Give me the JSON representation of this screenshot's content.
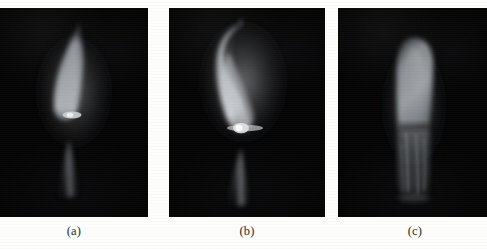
{
  "figure": {
    "kind": "three-panel-photograph-figure",
    "background_color": "#fdfdfc",
    "panel_background_color": "#050505",
    "panel_count": 3
  },
  "panels": [
    {
      "label": "(a)",
      "name": "flame-photo-a",
      "frame": {
        "x": 0,
        "y": 8,
        "width": 148,
        "height": 209
      },
      "caption_center_x": 74,
      "flame": {
        "description": "dim narrow leaf-shaped luminous flame leaning slightly right, with small bright elliptical spot at its base and faint conical tail below",
        "core_color": "#b9bcc0",
        "mid_color": "#6e7276",
        "edge_color": "#2e3134",
        "tail_color": "#4a4d50",
        "hotspot_color": "#e8eaec",
        "brightness": "dim",
        "tip_x": 78,
        "tip_y": 28,
        "base_x": 72,
        "base_y": 118,
        "hotspot_x": 74,
        "hotspot_y": 115,
        "tail_top_y": 140,
        "tail_bottom_y": 200
      }
    },
    {
      "label": "(b)",
      "name": "flame-photo-b",
      "frame": {
        "x": 169,
        "y": 8,
        "width": 156,
        "height": 209
      },
      "caption_center_x": 247,
      "flame": {
        "description": "bright strongly curved hooked flame with tip bending left at top, prominent white hotspot at base and faint conical tail below",
        "core_color": "#d5d8db",
        "mid_color": "#8a8e92",
        "edge_color": "#34373a",
        "tail_color": "#55585b",
        "hotspot_color": "#f4f5f6",
        "brightness": "bright",
        "tip_x": 241,
        "tip_y": 26,
        "base_x": 246,
        "base_y": 130,
        "hotspot_x": 241,
        "hotspot_y": 128,
        "tail_top_y": 148,
        "tail_bottom_y": 205
      }
    },
    {
      "label": "(c)",
      "name": "flame-photo-c",
      "frame": {
        "x": 338,
        "y": 8,
        "width": 149,
        "height": 209
      },
      "caption_center_x": 415,
      "flame": {
        "description": "tall straight columnar flame with rounded top, brighter upper section and dimmer textured lower section",
        "core_color": "#9fa3a7",
        "mid_color": "#63676b",
        "edge_color": "#2b2e31",
        "tail_color": "#4e5154",
        "hotspot_color": "#c6c9cc",
        "brightness": "medium",
        "tip_x": 414,
        "tip_y": 40,
        "base_x": 414,
        "base_y": 195,
        "upper_bottom_y": 125,
        "tail_top_y": 125,
        "tail_bottom_y": 195
      }
    }
  ],
  "captions": {
    "y": 224,
    "font_size_px": 12.5,
    "color": "#2a2a2a"
  }
}
